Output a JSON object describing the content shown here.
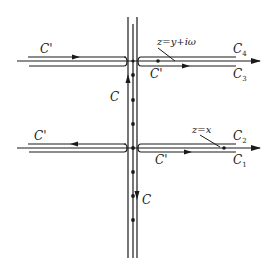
{
  "diagram": {
    "type": "contour-integration-diagram",
    "colors": {
      "stroke": "#1a1a1a",
      "background": "#ffffff"
    },
    "labels": {
      "upper_left_contour": "C'",
      "upper_right_contour": "C'",
      "lower_left_contour": "C'",
      "lower_right_contour": "C'",
      "vertical_upper": "C",
      "vertical_lower": "C",
      "c4": {
        "base": "C",
        "sub": "4"
      },
      "c3": {
        "base": "C",
        "sub": "3"
      },
      "c2": {
        "base": "C",
        "sub": "2"
      },
      "c1": {
        "base": "C",
        "sub": "1"
      },
      "upper_point": "z=y+iω",
      "lower_point": "z=x"
    },
    "vertical_dots_y": [
      75,
      100,
      124,
      148,
      172,
      196,
      220
    ],
    "horizontal_axes_y": [
      61,
      148
    ],
    "vertical_lines_x": [
      128,
      133,
      137
    ]
  }
}
